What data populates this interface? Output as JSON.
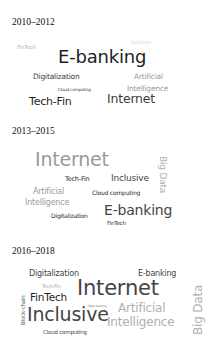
{
  "panels": [
    {
      "period": "2010–2012",
      "words": [
        {
          "text": "Inclusive",
          "color": "#d6d6d6"
        },
        {
          "text": "FinTech",
          "color": "#b4b4b4"
        },
        {
          "text": "E-banking",
          "color": "#1e1e1e"
        },
        {
          "text": "Digitalization",
          "color": "#3c3c3c"
        },
        {
          "text": "Artificial",
          "color": "#9a9a9a"
        },
        {
          "text": "Intelligence",
          "color": "#9a9a9a"
        },
        {
          "text": "Cloud computing",
          "color": "#3c3c3c"
        },
        {
          "text": "Tech-Fin",
          "color": "#1e1e1e"
        },
        {
          "text": "Internet",
          "color": "#3c3c3c"
        }
      ]
    },
    {
      "period": "2013–2015",
      "words": [
        {
          "text": "Internet",
          "color": "#9a9a9a"
        },
        {
          "text": "Big Data",
          "color": "#b0b0b0"
        },
        {
          "text": "Tech-Fin",
          "color": "#1e1e1e"
        },
        {
          "text": "Inclusive",
          "color": "#444444"
        },
        {
          "text": "Artificial",
          "color": "#9a9a9a"
        },
        {
          "text": "Intelligence",
          "color": "#9a9a9a"
        },
        {
          "text": "Cloud computing",
          "color": "#2a2a2a"
        },
        {
          "text": "Digitalization",
          "color": "#2a2a2a"
        },
        {
          "text": "E-banking",
          "color": "#444444"
        },
        {
          "text": "FinTech",
          "color": "#2a2a2a"
        }
      ]
    },
    {
      "period": "2016–2018",
      "words": [
        {
          "text": "Digitalization",
          "color": "#444444"
        },
        {
          "text": "E-banking",
          "color": "#444444"
        },
        {
          "text": "Tech-Fin",
          "color": "#aaaaaa"
        },
        {
          "text": "Internet",
          "color": "#444444"
        },
        {
          "text": "Block-chain",
          "color": "#555555"
        },
        {
          "text": "FinTech",
          "color": "#1e1e1e"
        },
        {
          "text": "Open banking",
          "color": "#888888"
        },
        {
          "text": "Artificial",
          "color": "#b0b0b0"
        },
        {
          "text": "Inclusive",
          "color": "#444444"
        },
        {
          "text": "Intelligence",
          "color": "#b0b0b0"
        },
        {
          "text": "Big Data",
          "color": "#b0b0b0"
        },
        {
          "text": "Cloud computing",
          "color": "#444444"
        }
      ]
    }
  ]
}
